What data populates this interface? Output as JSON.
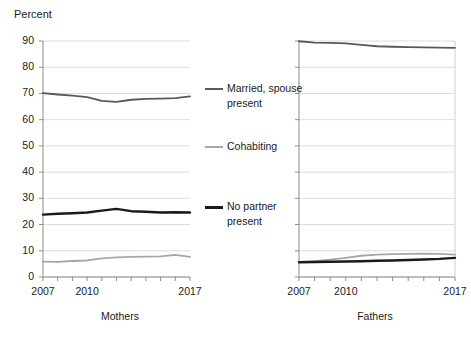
{
  "chart_data": {
    "type": "line",
    "title": "",
    "ylabel": "Percent",
    "xlabel": "",
    "ylim": [
      0,
      90
    ],
    "yticks": [
      0,
      10,
      20,
      30,
      40,
      50,
      60,
      70,
      80,
      90
    ],
    "ytick_labels": [
      "0",
      "10",
      "20",
      "30",
      "40",
      "50",
      "60",
      "70",
      "80",
      "90"
    ],
    "xlim": [
      2007,
      2017
    ],
    "xticks": [
      2007,
      2008,
      2009,
      2010,
      2011,
      2012,
      2013,
      2014,
      2015,
      2016,
      2017
    ],
    "xtick_labels_shown": [
      "2007",
      "2010",
      "2017"
    ],
    "grid": "horizontal",
    "legend_position": "center",
    "legend": [
      {
        "label": "Married, spouse present",
        "color": "#595959"
      },
      {
        "label": "Cohabiting",
        "color": "#a6a6a6"
      },
      {
        "label": "No partner present",
        "color": "#1a1a1a"
      }
    ],
    "panels": [
      {
        "name": "Mothers",
        "x": [
          2007,
          2008,
          2009,
          2010,
          2011,
          2012,
          2013,
          2014,
          2015,
          2016,
          2017
        ],
        "series": [
          {
            "name": "Married, spouse present",
            "color": "#595959",
            "width": 1.8,
            "values": [
              70.1,
              69.6,
              69.2,
              68.6,
              67.2,
              66.8,
              67.6,
              67.9,
              68.0,
              68.2,
              68.9
            ]
          },
          {
            "name": "Cohabiting",
            "color": "#a6a6a6",
            "width": 1.8,
            "values": [
              5.9,
              5.8,
              6.1,
              6.3,
              7.1,
              7.5,
              7.7,
              7.8,
              7.9,
              8.4,
              7.7
            ]
          },
          {
            "name": "No partner present",
            "color": "#1a1a1a",
            "width": 2.4,
            "values": [
              23.8,
              24.1,
              24.3,
              24.6,
              25.3,
              26.0,
              25.1,
              24.9,
              24.6,
              24.7,
              24.6
            ]
          }
        ]
      },
      {
        "name": "Fathers",
        "x": [
          2007,
          2008,
          2009,
          2010,
          2011,
          2012,
          2013,
          2014,
          2015,
          2016,
          2017
        ],
        "series": [
          {
            "name": "Married, spouse present",
            "color": "#595959",
            "width": 1.8,
            "values": [
              89.9,
              89.4,
              89.3,
              89.1,
              88.5,
              88.0,
              87.8,
              87.7,
              87.6,
              87.5,
              87.4
            ]
          },
          {
            "name": "Cohabiting",
            "color": "#a6a6a6",
            "width": 1.8,
            "values": [
              5.7,
              6.0,
              6.6,
              7.3,
              8.1,
              8.5,
              8.7,
              8.8,
              8.9,
              8.8,
              8.5
            ]
          },
          {
            "name": "No partner present",
            "color": "#1a1a1a",
            "width": 2.4,
            "values": [
              5.6,
              5.7,
              5.8,
              5.9,
              6.0,
              6.2,
              6.3,
              6.5,
              6.7,
              6.9,
              7.3
            ]
          }
        ]
      }
    ]
  },
  "labels": {
    "percent": "Percent",
    "mothers": "Mothers",
    "fathers": "Fathers",
    "year_first": "2007",
    "year_mid": "2010",
    "year_last": "2017"
  }
}
